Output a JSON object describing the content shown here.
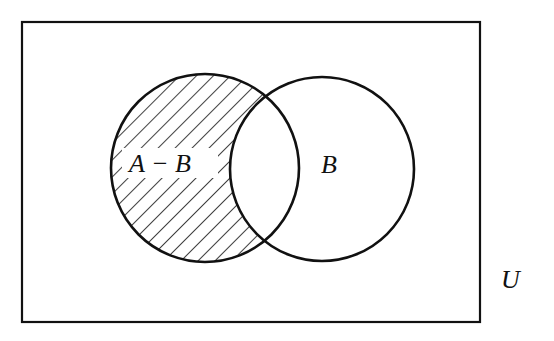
{
  "diagram": {
    "type": "venn",
    "universe": {
      "label": "U",
      "rect": {
        "x": 22,
        "y": 22,
        "width": 458,
        "height": 300
      }
    },
    "sets": [
      {
        "name": "A",
        "cx": 205,
        "cy": 168,
        "r": 94
      },
      {
        "name": "B",
        "cx": 322,
        "cy": 169,
        "r": 92
      }
    ],
    "shaded_region": "A - B",
    "labels": {
      "difference": "A − B",
      "set_b": "B",
      "universe": "U"
    },
    "colors": {
      "stroke": "#111111",
      "background": "#ffffff",
      "hatch": "#111111"
    }
  }
}
